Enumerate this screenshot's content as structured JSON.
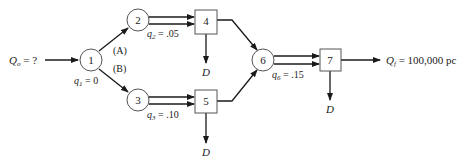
{
  "diagram": {
    "type": "flow-network",
    "input": {
      "symbol": "Q",
      "sub": "o",
      "value": "= ?"
    },
    "output": {
      "symbol": "Q",
      "sub": "f",
      "value": "= 100,000 pc"
    },
    "branches": {
      "a": "(A)",
      "b": "(B)"
    },
    "demand_label": "D",
    "nodes": [
      {
        "id": "1",
        "shape": "circle",
        "param": {
          "symbol": "q",
          "sub": "1",
          "value": "= 0"
        }
      },
      {
        "id": "2",
        "shape": "circle",
        "param": {
          "symbol": "q",
          "sub": "2",
          "value": "= .05"
        }
      },
      {
        "id": "3",
        "shape": "circle",
        "param": {
          "symbol": "q",
          "sub": "3",
          "value": "= .10"
        }
      },
      {
        "id": "4",
        "shape": "box"
      },
      {
        "id": "5",
        "shape": "box"
      },
      {
        "id": "6",
        "shape": "circle",
        "param": {
          "symbol": "q",
          "sub": "6",
          "value": "= .15"
        }
      },
      {
        "id": "7",
        "shape": "box"
      }
    ],
    "edges": [
      [
        "Qo",
        "1"
      ],
      [
        "1",
        "2"
      ],
      [
        "1",
        "3"
      ],
      [
        "2",
        "4"
      ],
      [
        "3",
        "5"
      ],
      [
        "4",
        "D"
      ],
      [
        "5",
        "D"
      ],
      [
        "4",
        "6"
      ],
      [
        "5",
        "6"
      ],
      [
        "6",
        "7"
      ],
      [
        "7",
        "D"
      ],
      [
        "7",
        "Qf"
      ]
    ]
  }
}
